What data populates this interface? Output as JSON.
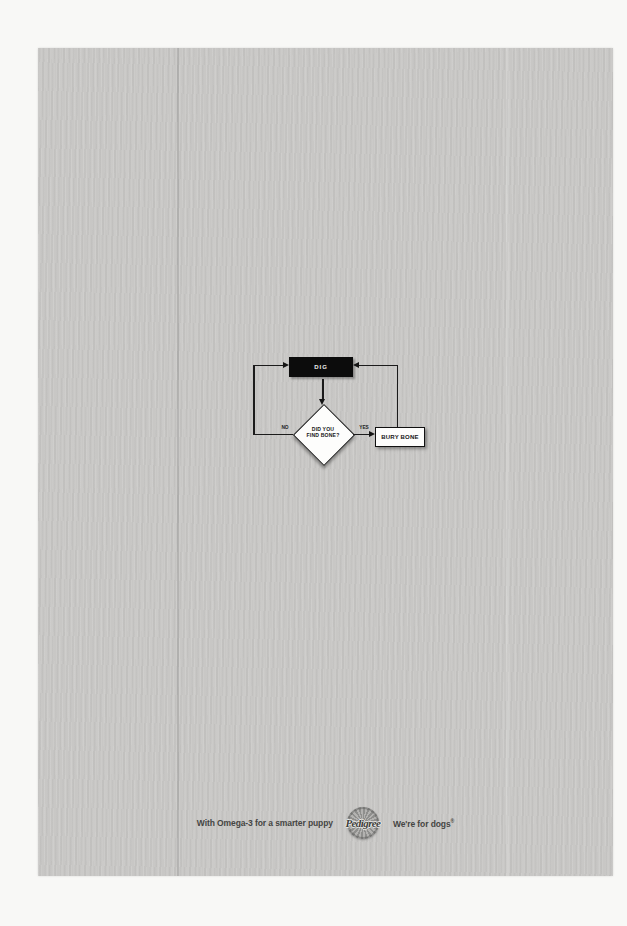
{
  "flowchart": {
    "dig_label": "DIG",
    "decision_line1": "DID YOU",
    "decision_line2": "FIND BONE?",
    "bury_label": "BURY BONE",
    "no_label": "NO",
    "yes_label": "YES"
  },
  "footer": {
    "tagline": "With Omega-3 for a smarter puppy",
    "brand": "Pedigree",
    "slogan_text": "We're for dogs",
    "slogan_mark": "®"
  },
  "colors": {
    "page_background": "#f8f8f6",
    "panel_background": "#c8c7c5",
    "flowchart_black": "#0c0c0c",
    "shape_fill": "#fdfdfc",
    "line_color": "#1b1b1b",
    "footer_text": "#454543",
    "rosette_gray": "#8f8f8d"
  }
}
